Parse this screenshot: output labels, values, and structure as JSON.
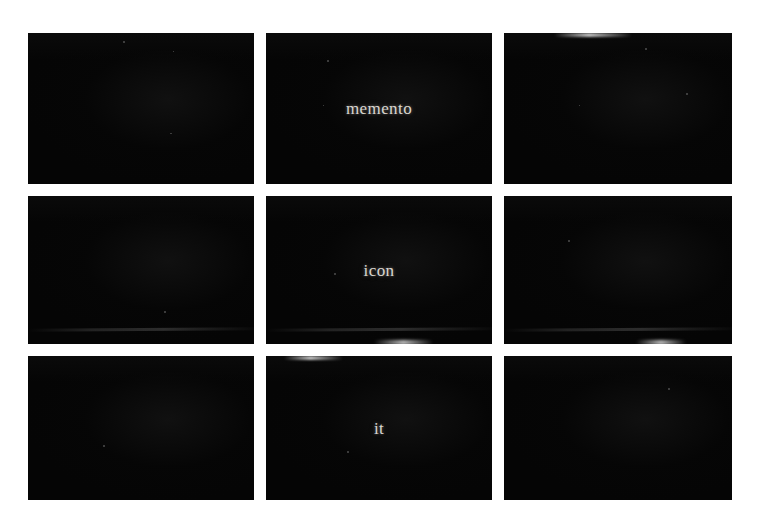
{
  "media": {
    "kind": "film-frame-contact-sheet",
    "background_color": "#ffffff",
    "frame_color": "#050505",
    "subtitle_color": "#d9d5cf",
    "columns": 3,
    "rows": 3,
    "total_frames": 9
  },
  "frames": [
    {
      "id": "frame-r1c1",
      "row": 1,
      "col": 1,
      "subtitle": ""
    },
    {
      "id": "frame-r1c2",
      "row": 1,
      "col": 2,
      "subtitle": "memento"
    },
    {
      "id": "frame-r1c3",
      "row": 1,
      "col": 3,
      "subtitle": ""
    },
    {
      "id": "frame-r2c1",
      "row": 2,
      "col": 1,
      "subtitle": ""
    },
    {
      "id": "frame-r2c2",
      "row": 2,
      "col": 2,
      "subtitle": "icon"
    },
    {
      "id": "frame-r2c3",
      "row": 2,
      "col": 3,
      "subtitle": ""
    },
    {
      "id": "frame-r3c1",
      "row": 3,
      "col": 1,
      "subtitle": ""
    },
    {
      "id": "frame-r3c2",
      "row": 3,
      "col": 2,
      "subtitle": "it"
    },
    {
      "id": "frame-r3c3",
      "row": 3,
      "col": 3,
      "subtitle": ""
    }
  ],
  "caption_sequence": "memento icon it"
}
